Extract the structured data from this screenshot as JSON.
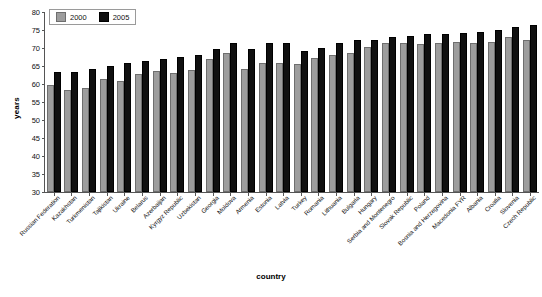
{
  "chart_data": {
    "type": "bar",
    "title": "",
    "xlabel": "country",
    "ylabel": "years",
    "ylim": [
      30,
      80
    ],
    "ytick_step": 5,
    "yticks": [
      80,
      75,
      70,
      65,
      60,
      55,
      50,
      45,
      40,
      35,
      30
    ],
    "grid": false,
    "legend_position": "top-left",
    "colors": {
      "y2000": "#9d9d9d",
      "y2005": "#101010"
    },
    "categories": [
      "Russian Federation",
      "Kazakhstan",
      "Turkmenistan",
      "Tajikistan",
      "Ukraine",
      "Belarus",
      "Azerbaijan",
      "Kyrgyz Republic",
      "Uzbekistan",
      "Georgia",
      "Moldova",
      "Armenia",
      "Estonia",
      "Latvia",
      "Turkey",
      "Romania",
      "Lithuania",
      "Bulgaria",
      "Hungary",
      "Serbia and Montenegro",
      "Slovak Republic",
      "Poland",
      "Bosnia and Herzegovina",
      "Macedonia FYR",
      "Albania",
      "Croatia",
      "Slovenia",
      "Czech Republic"
    ],
    "series": [
      {
        "name": "2000",
        "values": [
          59.2,
          57.7,
          58.2,
          60.9,
          60.2,
          62.3,
          63.0,
          62.6,
          63.3,
          66.4,
          68.0,
          63.6,
          65.2,
          65.4,
          65.0,
          66.8,
          67.5,
          68.0,
          69.8,
          70.8,
          70.8,
          70.5,
          70.7,
          71.0,
          70.9,
          71.2,
          72.6,
          71.6
        ]
      },
      {
        "name": "2005",
        "values": [
          62.8,
          62.8,
          63.6,
          64.5,
          65.2,
          65.7,
          66.4,
          66.9,
          67.4,
          69.2,
          70.7,
          69.2,
          70.8,
          70.9,
          68.6,
          69.5,
          70.8,
          71.6,
          71.7,
          72.5,
          72.9,
          73.2,
          73.3,
          73.5,
          74.0,
          74.4,
          75.2,
          75.8
        ]
      }
    ]
  },
  "legend": {
    "items": [
      {
        "label": "2000",
        "key": "y2000"
      },
      {
        "label": "2005",
        "key": "y2005"
      }
    ]
  }
}
